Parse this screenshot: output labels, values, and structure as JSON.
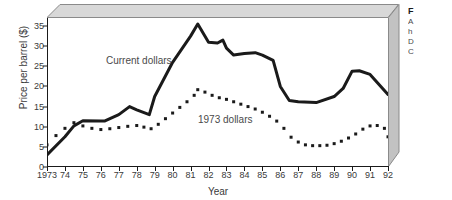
{
  "chart_data": {
    "type": "line",
    "title": "",
    "xlabel": "Year",
    "ylabel": "Price per barrel ($)",
    "xlim": [
      1973,
      1992
    ],
    "ylim": [
      0,
      37
    ],
    "yticks": [
      0,
      5,
      10,
      15,
      20,
      25,
      30,
      35
    ],
    "xticks": [
      "1973",
      "74",
      "75",
      "76",
      "77",
      "78",
      "79",
      "80",
      "81",
      "82",
      "83",
      "84",
      "85",
      "86",
      "87",
      "88",
      "89",
      "90",
      "91",
      "92"
    ],
    "grid": false,
    "legend_position": "inline-annotation",
    "series": [
      {
        "name": "Current dollars",
        "style": "solid",
        "color": "#1a1a1a",
        "annotation": "Current dollars",
        "x": [
          1973,
          1974,
          1974.5,
          1975,
          1976,
          1976.2,
          1977,
          1977.6,
          1978,
          1978.7,
          1979,
          1980,
          1981,
          1981.4,
          1982,
          1982.5,
          1982.8,
          1983,
          1983.4,
          1984,
          1984.6,
          1985,
          1985.6,
          1986,
          1986.5,
          1987,
          1988,
          1989,
          1989.5,
          1990,
          1990.4,
          1991,
          1992
        ],
        "values": [
          3.0,
          7.5,
          10.2,
          11.5,
          11.4,
          11.4,
          13.0,
          15.0,
          14.2,
          13.0,
          17.5,
          26.0,
          32.5,
          35.5,
          31.0,
          30.8,
          31.5,
          29.5,
          27.8,
          28.2,
          28.4,
          27.8,
          26.5,
          20.0,
          16.5,
          16.2,
          16.0,
          17.5,
          19.5,
          23.8,
          23.9,
          23.0,
          18.0
        ]
      },
      {
        "name": "1973 dollars",
        "style": "dotted",
        "color": "#1a1a1a",
        "annotation": "1973 dollars",
        "x": [
          1973,
          1973.5,
          1974,
          1974.5,
          1975,
          1975.5,
          1976,
          1976.5,
          1977,
          1977.5,
          1978,
          1978.4,
          1978.8,
          1979.2,
          1979.6,
          1980,
          1980.4,
          1980.8,
          1981.2,
          1981.4,
          1981.8,
          1982.2,
          1982.6,
          1983,
          1983.4,
          1983.8,
          1984.2,
          1984.6,
          1985,
          1985.4,
          1985.8,
          1986.2,
          1986.6,
          1987,
          1987.4,
          1987.8,
          1988.2,
          1988.6,
          1989,
          1989.4,
          1989.8,
          1990.2,
          1990.6,
          1991,
          1991.4,
          1991.8,
          1992
        ],
        "values": [
          5.5,
          7.8,
          9.6,
          11.0,
          10.2,
          9.6,
          9.3,
          9.5,
          9.8,
          10.1,
          10.3,
          9.9,
          9.5,
          10.6,
          12.0,
          13.4,
          14.8,
          16.2,
          17.8,
          19.2,
          18.6,
          17.8,
          17.2,
          16.8,
          16.2,
          15.6,
          15.0,
          14.4,
          13.6,
          12.6,
          11.4,
          9.6,
          7.4,
          6.2,
          5.5,
          5.3,
          5.3,
          5.4,
          5.8,
          6.4,
          7.2,
          8.2,
          9.4,
          10.2,
          10.3,
          9.6,
          7.5
        ]
      }
    ]
  },
  "frame": {
    "top_panel_color": "#d8d8d8",
    "right_panel_color": "#c2c2c2",
    "edge_color": "#8a8a8a"
  },
  "caption": {
    "title": "F",
    "lines": [
      "A",
      "h",
      "D",
      "C"
    ]
  }
}
